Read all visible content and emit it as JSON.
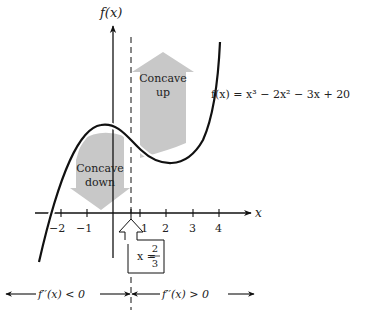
{
  "axes": {
    "y_label": "f(x)",
    "x_label": "x",
    "x_ticks": [
      {
        "value": -2,
        "label": "−2"
      },
      {
        "value": -1,
        "label": "−1"
      },
      {
        "value": 1,
        "label": "1"
      },
      {
        "value": 2,
        "label": "2"
      },
      {
        "value": 3,
        "label": "3"
      },
      {
        "value": 4,
        "label": "4"
      }
    ]
  },
  "function_label": "f(x) = x³ − 2x² − 3x + 20",
  "regions": {
    "up": {
      "line1": "Concave",
      "line2": "up"
    },
    "down": {
      "line1": "Concave",
      "line2": "down"
    }
  },
  "inflection": {
    "label_x": "x =",
    "numerator": "2",
    "denominator": "3"
  },
  "intervals": {
    "left": "f′′(x) < 0",
    "right": "f′′(x) > 0"
  },
  "colors": {
    "curve": "#111111",
    "arrow_fill": "#c8c8c8",
    "text": "#222222"
  }
}
